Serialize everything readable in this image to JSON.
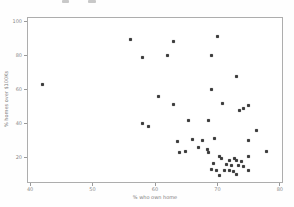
{
  "figure": {
    "background": "#ffffff",
    "frame_color": "#adadad",
    "tick_color": "#9a9a9a",
    "label_color": "#7d7d7d"
  },
  "chart_data": {
    "type": "scatter",
    "title": "",
    "xlabel": "% who own home",
    "ylabel": "% homes over $100Ks",
    "xlim": [
      39.5,
      80.5
    ],
    "ylim": [
      5,
      102.5
    ],
    "x_ticks": [
      40,
      50,
      60,
      70,
      80
    ],
    "y_ticks": [
      20,
      40,
      60,
      80,
      100
    ],
    "grid": false,
    "legend": "none",
    "marker": {
      "shape": "square",
      "size_px": 3,
      "color": "#3d3d3d"
    },
    "points": [
      [
        42,
        63
      ],
      [
        56,
        89
      ],
      [
        58,
        79
      ],
      [
        60.5,
        56
      ],
      [
        70,
        91
      ],
      [
        63,
        88
      ],
      [
        62,
        80
      ],
      [
        69,
        80
      ],
      [
        73,
        67.5
      ],
      [
        69,
        60
      ],
      [
        58,
        40
      ],
      [
        59,
        38
      ],
      [
        63,
        51
      ],
      [
        70.8,
        51.5
      ],
      [
        75,
        50.5
      ],
      [
        73.6,
        47.4
      ],
      [
        74.2,
        48.5
      ],
      [
        65.3,
        41.8
      ],
      [
        68.6,
        41.8
      ],
      [
        76.2,
        36
      ],
      [
        66,
        30.5
      ],
      [
        67.6,
        29.8
      ],
      [
        69.6,
        31
      ],
      [
        75,
        30
      ],
      [
        63.6,
        29.3
      ],
      [
        67,
        26
      ],
      [
        64.9,
        23.5
      ],
      [
        64,
        22.7
      ],
      [
        68.4,
        24.7
      ],
      [
        68.6,
        23.1
      ],
      [
        77.8,
        23.3
      ],
      [
        70.3,
        20.8
      ],
      [
        70.7,
        19.2
      ],
      [
        71.9,
        18.4
      ],
      [
        72.8,
        19.6
      ],
      [
        73.1,
        18.2
      ],
      [
        73.8,
        17.8
      ],
      [
        74.9,
        20.4
      ],
      [
        69.3,
        16.5
      ],
      [
        71.5,
        15.7
      ],
      [
        72.3,
        15.2
      ],
      [
        73.4,
        15.5
      ],
      [
        74.1,
        14.9
      ],
      [
        69,
        12.8
      ],
      [
        69.9,
        12.2
      ],
      [
        71.2,
        12.4
      ],
      [
        71.9,
        12.6
      ],
      [
        72.6,
        11.8
      ],
      [
        74.9,
        12.2
      ],
      [
        70.4,
        9.6
      ],
      [
        73.1,
        10.2
      ]
    ]
  }
}
